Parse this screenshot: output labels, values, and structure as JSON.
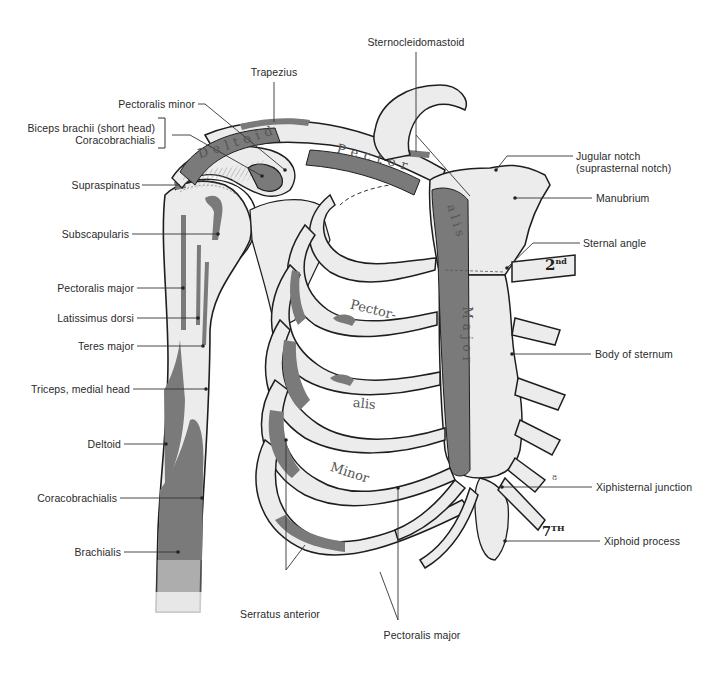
{
  "figure": {
    "colors": {
      "bone": "#ececec",
      "bone_outline": "#1e1e1e",
      "muscle_attachment": "#7a7a7a",
      "leader_line": "#333333",
      "label_text": "#2a2a2a"
    }
  },
  "labels": {
    "left": {
      "pectoralis_minor": "Pectoralis minor",
      "biceps_short_head": "Biceps brachii (short head)",
      "coracobrachialis_top": "Coracobrachialis",
      "supraspinatus": "Supraspinatus",
      "subscapularis": "Subscapularis",
      "pectoralis_major": "Pectoralis major",
      "latissimus_dorsi": "Latissimus dorsi",
      "teres_major": "Teres major",
      "triceps_medial_head": "Triceps, medial head",
      "deltoid": "Deltoid",
      "coracobrachialis": "Coracobrachialis",
      "brachialis": "Brachialis"
    },
    "top": {
      "trapezius": "Trapezius",
      "sternocleidomastoid": "Sternocleidomastoid"
    },
    "right": {
      "jugular_notch": "Jugular notch",
      "jugular_notch_alt": "(suprasternal notch)",
      "manubrium": "Manubrium",
      "sternal_angle": "Sternal angle",
      "body_of_sternum": "Body of sternum",
      "xiphisternal_junction": "Xiphisternal junction",
      "xiphoid_process": "Xiphoid process"
    },
    "bottom": {
      "serratus_anterior": "Serratus anterior",
      "pectoralis_major": "Pectoralis major"
    }
  },
  "in_drawing_text": {
    "deltoid_on_clavicle": "Deltoid",
    "pector_on_clavicle": "Pector",
    "alis_on_sternum": "alis",
    "major_on_sternum": "Major",
    "pector_rib": "Pector-",
    "alis_rib": "alis",
    "minor_rib": "Minor",
    "rib_2": "2",
    "rib_2_suffix": "nd",
    "rib_7": "7",
    "rib_7_suffix": "TH",
    "rib_8_marker": "8"
  }
}
